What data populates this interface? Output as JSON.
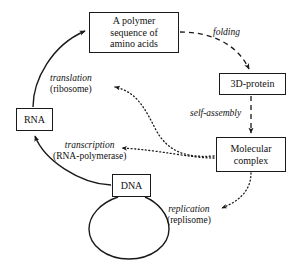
{
  "diagram": {
    "background": "#ffffff",
    "stroke_color": "#1a1a1a",
    "nodes": {
      "polymer": {
        "line1": "A polymer",
        "line2": "sequence of",
        "line3": "amino acids"
      },
      "protein": {
        "line1": "3D-protein"
      },
      "complex": {
        "line1": "Molecular",
        "line2": "complex"
      },
      "rna": {
        "line1": "RNA"
      },
      "dna": {
        "line1": "DNA"
      }
    },
    "edges": {
      "folding": {
        "name": "folding",
        "detail": ""
      },
      "self_assembly": {
        "name": "self-assembly",
        "detail": ""
      },
      "translation": {
        "name": "translation",
        "detail": "(ribosome)"
      },
      "transcription": {
        "name": "transcription",
        "detail": "(RNA-polymerase)"
      },
      "replication": {
        "name": "replication",
        "detail": "(replisome)"
      }
    }
  }
}
